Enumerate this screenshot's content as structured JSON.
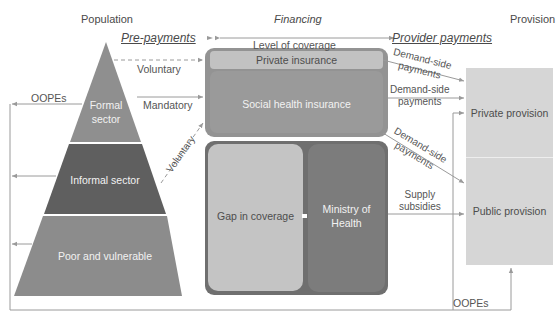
{
  "headers": {
    "population": "Population",
    "financing": "Financing",
    "provision": "Provision",
    "pre_payments": "Pre-payments",
    "provider_payments": "Provider payments",
    "level_of_coverage": "Level of coverage"
  },
  "population": {
    "tiers": [
      {
        "label_line1": "Formal",
        "label_line2": "sector",
        "color": "#8f8f8f"
      },
      {
        "label": "Informal sector",
        "color": "#5f5f5f"
      },
      {
        "label": "Poor and vulnerable",
        "color": "#8c8c8c"
      }
    ]
  },
  "financing": {
    "private_insurance": "Private insurance",
    "social_health_insurance": "Social health insurance",
    "gap_in_coverage": "Gap in coverage",
    "ministry_line1": "Ministry of",
    "ministry_line2": "Health",
    "colors": {
      "upper_box": "#939393",
      "private_strip": "#bdbdbd",
      "lower_box": "#6f6f6f",
      "gap_box": "#c4c4c4",
      "ministry_box": "#7a7a7a"
    }
  },
  "provision": {
    "private": "Private provision",
    "public": "Public provision",
    "color": "#d6d6d6"
  },
  "flows": {
    "voluntary_top": "Voluntary",
    "mandatory": "Mandatory",
    "voluntary_diag": "Voluntary",
    "oopes_left": "OOPEs",
    "oopes_bottom": "OOPEs",
    "demand_side_1_line1": "Demand-side",
    "demand_side_1_line2": "payments",
    "demand_side_2_line1": "Demand-side",
    "demand_side_2_line2": "payments",
    "demand_side_3_line1": "Demand-side",
    "demand_side_3_line2": "payments",
    "supply_line1": "Supply",
    "supply_line2": "subsidies"
  },
  "line_color": "#9a9a9a"
}
